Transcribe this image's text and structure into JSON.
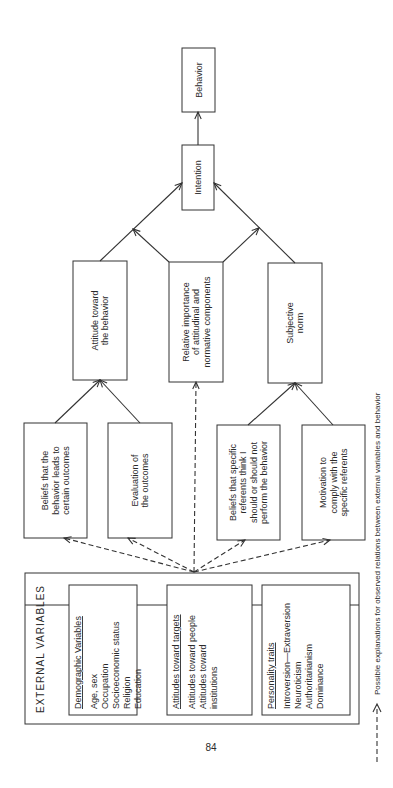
{
  "nodes": {
    "behavior": [
      "Behavior"
    ],
    "intention": [
      "Intention"
    ],
    "attitude": [
      "Attitude toward",
      "the behavior"
    ],
    "relative_importance": [
      "Relative importance",
      "of attitudinal and",
      "normative components"
    ],
    "subjective_norm": [
      "Subjective",
      "norm"
    ],
    "beliefs_outcomes": [
      "Beliefs that the",
      "behavior leads to",
      "certain outcomes"
    ],
    "evaluation": [
      "Evaluation of",
      "the outcomes"
    ],
    "beliefs_referents": [
      "Beliefs that specific",
      "referents think I",
      "should or should not",
      "perform the behavior"
    ],
    "motivation": [
      "Motivation to",
      "comply with the",
      "specific referents"
    ]
  },
  "external_variables": {
    "title": "EXTERNAL VARIABLES",
    "groups": [
      {
        "heading": "Demographic Variables",
        "items": [
          "Age, sex",
          "Occupation",
          "Socioeconomic status",
          "Religion",
          "Education"
        ]
      },
      {
        "heading": "Attitudes toward targets",
        "items": [
          "Attitudes toward people",
          "Attitudes toward",
          "institutions"
        ]
      },
      {
        "heading": "Personality traits",
        "items": [
          "Introversion—Extraversion",
          "Neuroticism",
          "Authoritarianism",
          "Dominance"
        ]
      }
    ]
  },
  "page_number": "84",
  "legend": {
    "text": "Possible explanations for observed relations between external variables and behavior",
    "line_style": "dashed-arrow"
  }
}
